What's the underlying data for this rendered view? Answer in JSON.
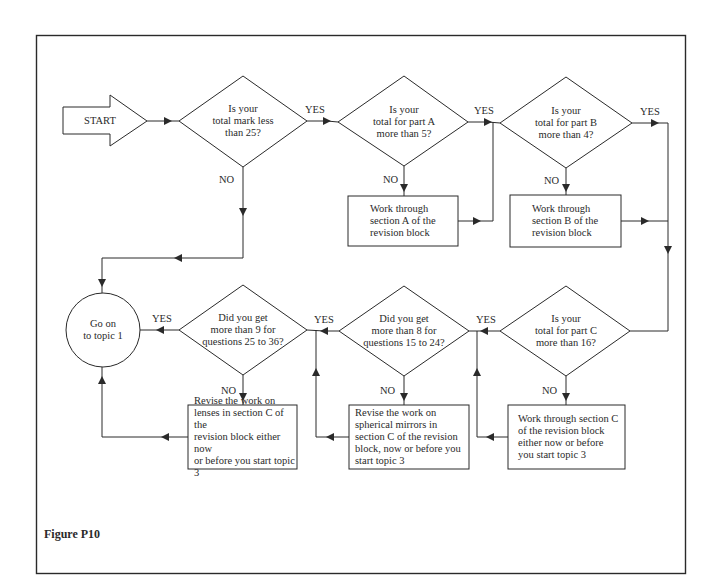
{
  "figure": {
    "caption": "Figure P10",
    "start_label": "START",
    "end_label": "Go on\nto topic 1"
  },
  "decisions": [
    {
      "id": "d1",
      "text": "Is your\ntotal mark less\nthan 25?",
      "yes_label": "YES",
      "no_label": "NO"
    },
    {
      "id": "d2",
      "text": "Is your\ntotal for part A\nmore than 5?",
      "yes_label": "YES",
      "no_label": "NO"
    },
    {
      "id": "d3",
      "text": "Is your\ntotal for part B\nmore than 4?",
      "yes_label": "YES",
      "no_label": "NO"
    },
    {
      "id": "d4",
      "text": "Is your\ntotal for part C\nmore than 16?",
      "yes_label": "YES",
      "no_label": "NO"
    },
    {
      "id": "d5",
      "text": "Did you get\nmore than 8 for\nquestions 15 to 24?",
      "yes_label": "YES",
      "no_label": "NO"
    },
    {
      "id": "d6",
      "text": "Did you get\nmore than 9 for\nquestions 25 to 36?",
      "yes_label": "YES",
      "no_label": "NO"
    }
  ],
  "actions": [
    {
      "id": "a1",
      "text": "Work through\nsection A of the\nrevision block"
    },
    {
      "id": "a2",
      "text": "Work through\nsection B of the\nrevision block"
    },
    {
      "id": "a3",
      "text": "Work through section C\nof the revision block\neither now or before\nyou start topic 3"
    },
    {
      "id": "a4",
      "text": "Revise the work on\nspherical mirrors in\nsection C of the revision\nblock, now or before you\nstart topic 3"
    },
    {
      "id": "a5",
      "text": "Revise the work on\nlenses in section C of the\nrevision block either now\nor before you start topic 3"
    }
  ],
  "colors": {
    "line": "#2a2a2a",
    "background": "#ffffff"
  }
}
